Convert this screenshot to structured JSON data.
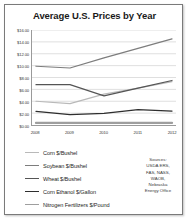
{
  "chart_data": {
    "type": "line",
    "title": "Average U.S. Prices by Year",
    "xlabel": "",
    "ylabel": "",
    "categories": [
      "2008",
      "2009",
      "2010",
      "2011",
      "2012"
    ],
    "x": [
      2008,
      2009,
      2010,
      2011,
      2012
    ],
    "ylim": [
      0,
      16
    ],
    "yticks": [
      0,
      2,
      4,
      6,
      8,
      10,
      12,
      14,
      16
    ],
    "ytick_labels": [
      "$0.00",
      "$2.00",
      "$4.00",
      "$6.00",
      "$8.00",
      "$10.00",
      "$12.00",
      "$14.00",
      "$16.00"
    ],
    "grid": true,
    "legend_position": "bottom-left",
    "series": [
      {
        "name": "Corn $/Bushel",
        "color": "#b9b9b9",
        "values": [
          4.0,
          3.6,
          5.2,
          6.2,
          7.3
        ]
      },
      {
        "name": "Soybean $/Bushel",
        "color": "#7d7d7d",
        "values": [
          9.9,
          9.6,
          11.3,
          12.9,
          14.5
        ]
      },
      {
        "name": "Wheat $/Bushel",
        "color": "#555555",
        "values": [
          6.8,
          6.8,
          4.9,
          6.2,
          7.5
        ]
      },
      {
        "name": "Corn Ethanol $/Gallon",
        "color": "#2e2e2e",
        "values": [
          2.3,
          1.75,
          1.95,
          2.6,
          2.35
        ]
      },
      {
        "name": "Nitrogen Fertilizers $/Pound",
        "color": "#9e9e9e",
        "values": [
          0.35,
          0.35,
          0.35,
          0.35,
          0.35
        ]
      }
    ]
  },
  "sources": {
    "heading": "Sources:",
    "lines": [
      "USDA ERS,",
      "FAS, NASS,",
      "WAOB,",
      "Nebraska",
      "Energy Office"
    ]
  }
}
